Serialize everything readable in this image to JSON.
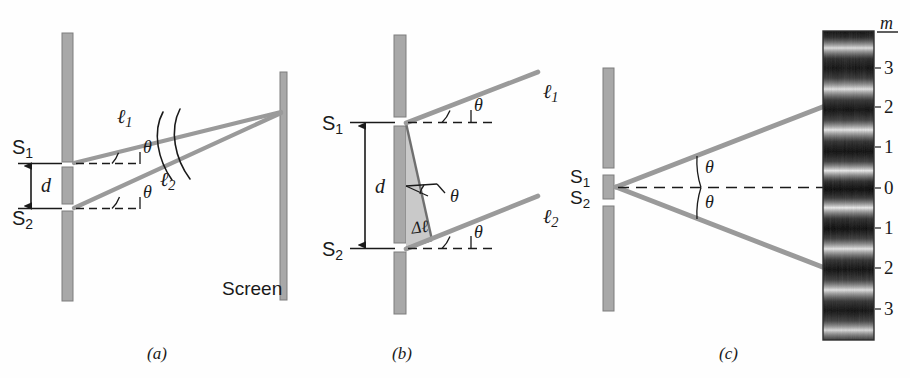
{
  "figure": {
    "type": "physics-optics-diagram",
    "panels": [
      {
        "id": "a",
        "caption": "(a)"
      },
      {
        "id": "b",
        "caption": "(b)"
      },
      {
        "id": "c",
        "caption": "(c)"
      }
    ]
  },
  "colors": {
    "ray": "#9a9a9a",
    "barrier_fill": "#a8a8a8",
    "barrier_stroke": "#7d7d7d",
    "triangle_fill": "#c9c9c9",
    "ink": "#1a1a1a",
    "dashed": "#1a1a1a",
    "background": "#fefefe"
  },
  "panel_a": {
    "caption": "(a)",
    "slit_top_label": "S",
    "slit_top_sub": "1",
    "slit_bottom_label": "S",
    "slit_bottom_sub": "2",
    "separation_label": "d",
    "ray1_label": "ℓ",
    "ray1_sub": "1",
    "ray2_label": "ℓ",
    "ray2_sub": "2",
    "angle_top_label": "θ",
    "angle_bottom_label": "θ",
    "screen_label": "Screen"
  },
  "panel_b": {
    "caption": "(b)",
    "slit_top_label": "S",
    "slit_top_sub": "1",
    "slit_bottom_label": "S",
    "slit_bottom_sub": "2",
    "separation_label": "d",
    "ray1_label": "ℓ",
    "ray1_sub": "1",
    "ray2_label": "ℓ",
    "ray2_sub": "2",
    "angle_top_label": "θ",
    "angle_mid_label": "θ",
    "angle_bottom_label": "θ",
    "path_difference_label": "Δℓ"
  },
  "panel_c": {
    "caption": "(c)",
    "slit_top_label": "S",
    "slit_top_sub": "1",
    "slit_bottom_label": "S",
    "slit_bottom_sub": "2",
    "angle_upper_label": "θ",
    "angle_lower_label": "θ",
    "order_axis_label": "m",
    "order_labels": [
      {
        "value": "3",
        "y": 68
      },
      {
        "value": "2",
        "y": 107
      },
      {
        "value": "1",
        "y": 147
      },
      {
        "value": "0",
        "y": 188
      },
      {
        "value": "1",
        "y": 228
      },
      {
        "value": "2",
        "y": 268
      },
      {
        "value": "3",
        "y": 309
      }
    ],
    "fringe_bright_centers": [
      48,
      88,
      128,
      168,
      188,
      208,
      248,
      288,
      328
    ]
  }
}
